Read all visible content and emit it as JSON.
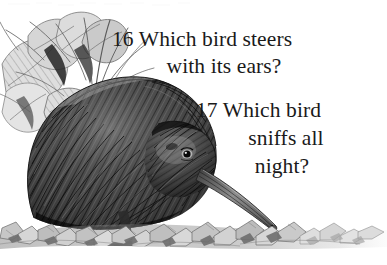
{
  "page": {
    "width": 387,
    "height": 265,
    "background_color": "#ffffff",
    "text_color": "#1a1a1a"
  },
  "questions": [
    {
      "number": "16",
      "line1": "16 Which bird steers",
      "line2": "with its ears?",
      "full_text": "16 Which bird steers with its ears?"
    },
    {
      "number": "17",
      "line1": "17 Which bird",
      "line2": "sniffs all",
      "line3": "night?",
      "full_text": "17 Which bird sniffs all night?"
    }
  ],
  "illustration": {
    "subject": "kiwi-bird",
    "style": "pen-and-ink stipple hatching, grayscale",
    "elements": [
      "kiwi-bird-body",
      "kiwi-bird-head",
      "kiwi-bird-eye",
      "kiwi-bird-beak",
      "kiwi-bird-leg",
      "foliage-leaves",
      "grass-blades",
      "leaf-litter-ground"
    ],
    "palette": {
      "darkest": "#1c1c1c",
      "dark": "#3a3a3a",
      "mid": "#6e6e6e",
      "light": "#a8a8a8",
      "lightest": "#d8d8d8",
      "paper": "#ffffff"
    }
  }
}
